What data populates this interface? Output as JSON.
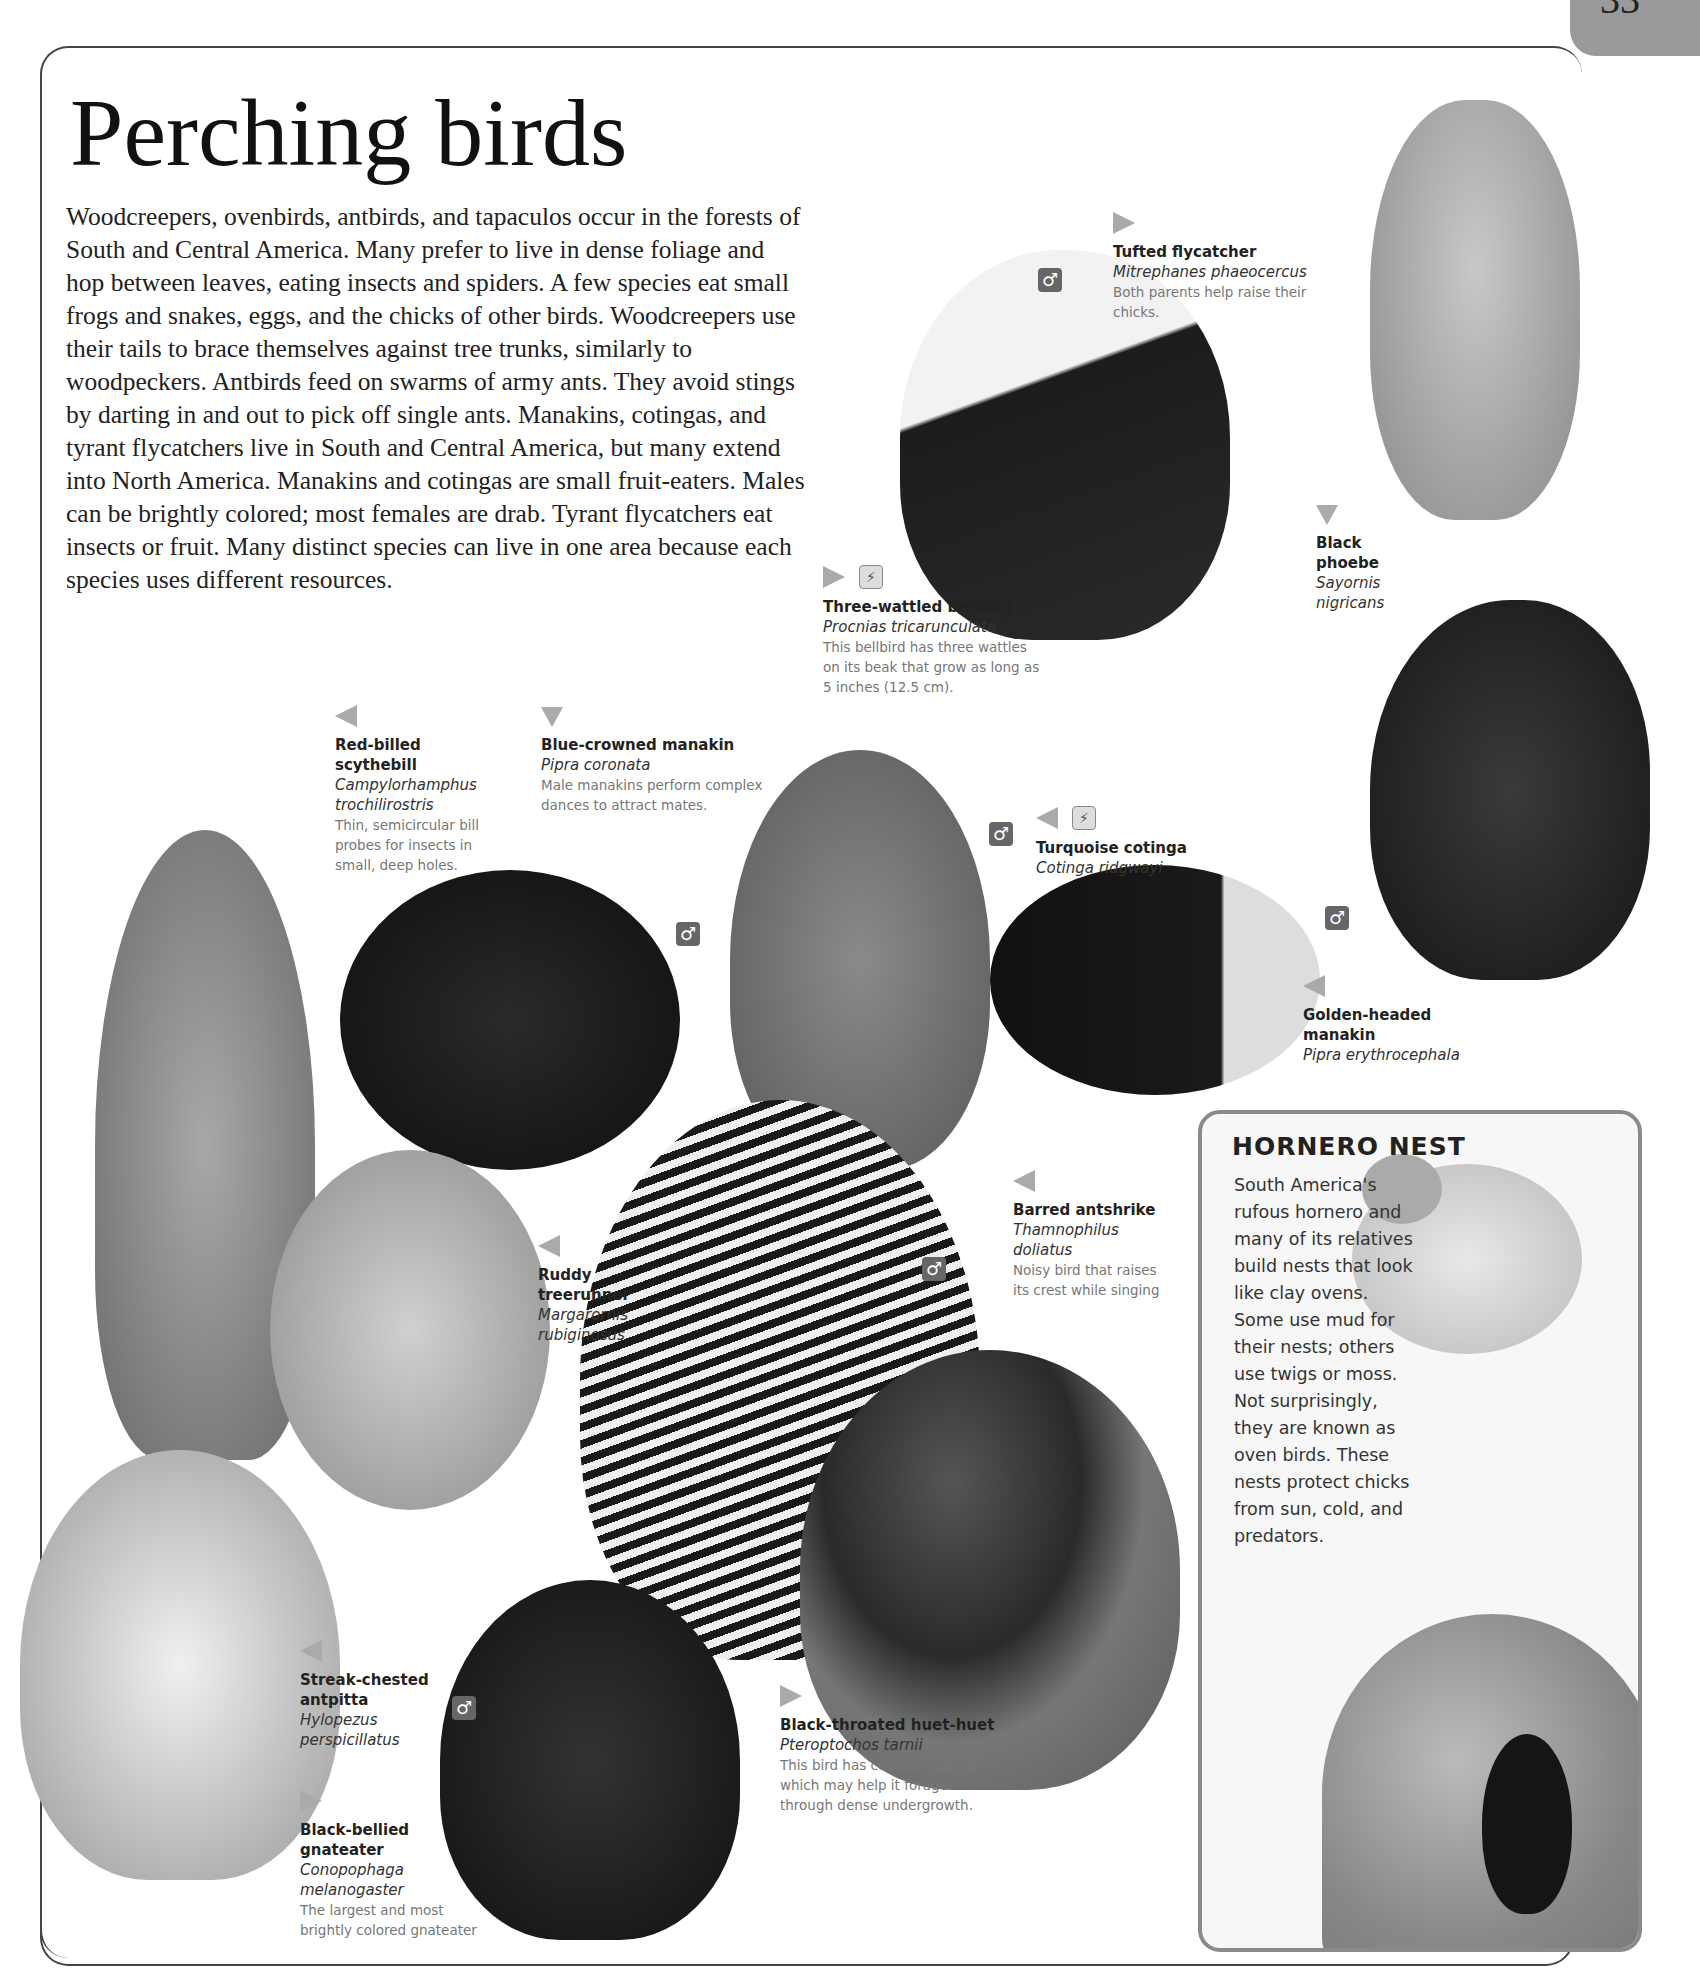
{
  "page": {
    "number": "33",
    "title": "Perching birds",
    "intro": "Woodcreepers, ovenbirds, antbirds, and tapaculos occur in the forests of South and Central America. Many prefer to live in dense foliage and hop between leaves, eating insects and spiders. A few species eat small frogs and snakes, eggs, and the chicks of other birds. Woodcreepers use their tails to brace themselves against tree trunks, similarly to woodpeckers. Antbirds feed on swarms of army ants. They avoid stings by darting in and out to pick off single ants. Manakins, cotingas, and tyrant flycatchers live in South and Central America, but many extend into North America. Manakins and cotingas are small fruit-eaters. Males can be brightly colored; most females are drab. Tyrant flycatchers eat insects or fruit. Many distinct species can live in one area because each species uses different resources."
  },
  "icons": {
    "male_symbol": "♂",
    "endangered_symbol": "⚡"
  },
  "birds": [
    {
      "common": "Tufted flycatcher",
      "scientific": "Mitrephanes phaeocercus",
      "description": "Both parents help raise their chicks.",
      "arrow": "right"
    },
    {
      "common": "Three-wattled bellbird",
      "scientific": "Procnias tricarunculata",
      "description": "This bellbird has three wattles on its beak that grow as long as 5 inches (12.5 cm).",
      "arrow": "right"
    },
    {
      "common": "Black phoebe",
      "scientific": "Sayornis nigricans",
      "description": "",
      "arrow": "down"
    },
    {
      "common": "Red-billed scythebill",
      "scientific": "Campylorhamphus trochilirostris",
      "description": "Thin, semicircular bill probes for insects in small, deep holes.",
      "arrow": "left"
    },
    {
      "common": "Blue-crowned manakin",
      "scientific": "Pipra coronata",
      "description": "Male manakins perform complex dances to attract mates.",
      "arrow": "down"
    },
    {
      "common": "Turquoise cotinga",
      "scientific": "Cotinga ridgwayi",
      "description": "",
      "arrow": "left"
    },
    {
      "common": "Golden-headed manakin",
      "scientific": "Pipra erythrocephala",
      "description": "",
      "arrow": "left"
    },
    {
      "common": "Barred antshrike",
      "scientific": "Thamnophilus doliatus",
      "description": "Noisy bird that raises its crest while singing",
      "arrow": "left"
    },
    {
      "common": "Ruddy treerunner",
      "scientific": "Margarornis rubiginosus",
      "description": "",
      "arrow": "left"
    },
    {
      "common": "Streak-chested antpitta",
      "scientific": "Hylopezus perspicillatus",
      "description": "",
      "arrow": "left"
    },
    {
      "common": "Black-bellied gnateater",
      "scientific": "Conopophaga melanogaster",
      "description": "The largest and most brightly colored gnateater",
      "arrow": "right"
    },
    {
      "common": "Black-throated huet-huet",
      "scientific": "Pteroptochos tarnii",
      "description": "This bird has covered nostrils, which may help it forage through dense undergrowth.",
      "arrow": "right"
    }
  ],
  "sidebar": {
    "title": "HORNERO NEST",
    "text": "South America's rufous hornero and many of its relatives build nests that look like clay ovens. Some use mud for their nests; others use twigs or moss. Not surprisingly, they are known as oven birds. These nests protect chicks from sun, cold, and predators."
  }
}
